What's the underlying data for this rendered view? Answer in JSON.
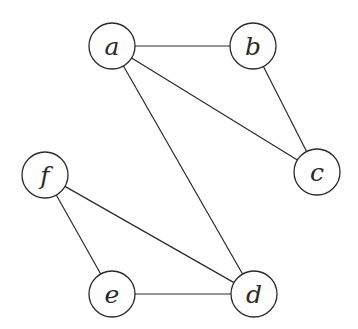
{
  "diagram": {
    "type": "undirected-graph",
    "colors": {
      "stroke": "#2a2a2a",
      "node_fill": "#ffffff",
      "background": "#ffffff"
    },
    "node_radius": 23,
    "nodes": [
      {
        "id": "a",
        "label": "a",
        "x": 112,
        "y": 46
      },
      {
        "id": "b",
        "label": "b",
        "x": 253,
        "y": 46
      },
      {
        "id": "c",
        "label": "c",
        "x": 317,
        "y": 172
      },
      {
        "id": "d",
        "label": "d",
        "x": 254,
        "y": 294
      },
      {
        "id": "e",
        "label": "e",
        "x": 112,
        "y": 294
      },
      {
        "id": "f",
        "label": "f",
        "x": 45,
        "y": 175
      }
    ],
    "edges": [
      {
        "from": "a",
        "to": "b"
      },
      {
        "from": "a",
        "to": "c"
      },
      {
        "from": "a",
        "to": "d"
      },
      {
        "from": "b",
        "to": "c"
      },
      {
        "from": "f",
        "to": "d"
      },
      {
        "from": "f",
        "to": "e"
      },
      {
        "from": "e",
        "to": "d"
      }
    ]
  }
}
